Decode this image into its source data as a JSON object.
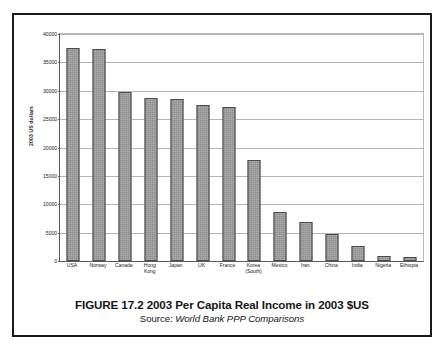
{
  "figure": {
    "title": "FIGURE 17.2 2003 Per Capita Real Income in 2003 $US",
    "source_prefix": "Source:",
    "source_name": "World Bank PPP Comparisons"
  },
  "colors": {
    "bar_fill": "#8d8d8d",
    "bar_border": "#4a4a4a",
    "gridline": "#b4b4b4",
    "axis": "#5a5a5a",
    "frame": "#1a1a1a",
    "text": "#1a1a1a",
    "background": "#ffffff"
  },
  "chart_data": {
    "type": "bar",
    "title": "FIGURE 17.2 2003 Per Capita Real Income in 2003 $US",
    "subtitle": "Source: World Bank PPP Comparisons",
    "xlabel": "",
    "ylabel": "2003 US dollars",
    "ylim": [
      0,
      40000
    ],
    "ytick_step": 5000,
    "yticks": [
      0,
      5000,
      10000,
      15000,
      20000,
      25000,
      30000,
      35000,
      40000
    ],
    "ytick_labels": [
      "0",
      "5000",
      "10000",
      "15000",
      "20000",
      "25000",
      "30000",
      "35000",
      "40000"
    ],
    "grid": true,
    "legend": false,
    "categories": [
      "USA",
      "Norway",
      "Canada",
      "Hong Kong",
      "Japan",
      "UK",
      "France",
      "Korea (South)",
      "Mexico",
      "Iran",
      "China",
      "India",
      "Nigeria",
      "Ethiopia"
    ],
    "category_lines": [
      [
        "USA"
      ],
      [
        "Norway"
      ],
      [
        "Canada"
      ],
      [
        "Hong",
        "Kong"
      ],
      [
        "Japan"
      ],
      [
        "UK"
      ],
      [
        "France"
      ],
      [
        "Korea",
        "(South)"
      ],
      [
        "Mexico"
      ],
      [
        "Iran"
      ],
      [
        "China"
      ],
      [
        "India"
      ],
      [
        "Nigeria"
      ],
      [
        "Ethiopia"
      ]
    ],
    "values": [
      37500,
      37300,
      29700,
      28700,
      28500,
      27500,
      27200,
      17800,
      8700,
      6900,
      4700,
      2600,
      900,
      700
    ]
  }
}
